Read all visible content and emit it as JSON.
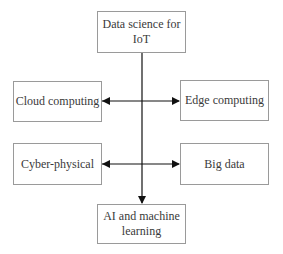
{
  "diagram": {
    "nodes": [
      {
        "id": "top",
        "label": "Data science for IoT",
        "line1": "Data science for",
        "line2": "IoT"
      },
      {
        "id": "cloud",
        "label": "Cloud computing"
      },
      {
        "id": "edge",
        "label": "Edge computing"
      },
      {
        "id": "cyber",
        "label": "Cyber-physical"
      },
      {
        "id": "bigdata",
        "label": "Big data"
      },
      {
        "id": "ai",
        "label": "AI and machine learning",
        "line1": "AI and machine",
        "line2": "learning"
      }
    ],
    "edges": [
      {
        "from": "top",
        "to": "ai",
        "type": "arrow"
      },
      {
        "from": "cloud",
        "to": "edge",
        "type": "bidirectional"
      },
      {
        "from": "cyber",
        "to": "bigdata",
        "type": "bidirectional"
      }
    ],
    "colors": {
      "border": "#9a9a9a",
      "line": "#111111",
      "text": "#3a3a3a"
    }
  }
}
